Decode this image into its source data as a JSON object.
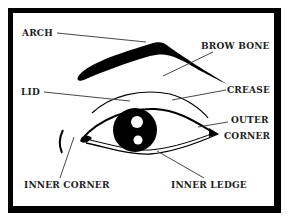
{
  "diagram": {
    "type": "labeled-illustration",
    "labels": {
      "arch": "ARCH",
      "brow_bone": "BROW BONE",
      "lid": "LID",
      "crease": "CREASE",
      "outer_corner_line1": "OUTER",
      "outer_corner_line2": "CORNER",
      "inner_corner": "INNER CORNER",
      "inner_ledge": "INNER LEDGE"
    },
    "colors": {
      "ink": "#000000",
      "label_text": "#222222",
      "leader_line": "#333333",
      "background": "#ffffff"
    }
  }
}
